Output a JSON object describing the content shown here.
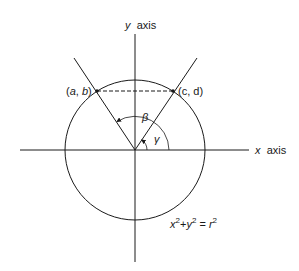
{
  "diagram": {
    "axes": {
      "y_label_var": "y",
      "y_label_word": "axis",
      "x_label_var": "x",
      "x_label_word": "axis"
    },
    "points": {
      "left": {
        "open": "(",
        "a": "a",
        "sep": ", ",
        "b": "b",
        "close": ")"
      },
      "right": {
        "text": "(c, d)"
      }
    },
    "angles": {
      "beta": "β",
      "gamma": "γ"
    },
    "equation": {
      "x": "x",
      "plus": "+",
      "y": "y",
      "eq": "=",
      "r": "r",
      "exp": "2"
    },
    "colors": {
      "stroke": "#1a1a1a",
      "background": "#ffffff"
    }
  }
}
